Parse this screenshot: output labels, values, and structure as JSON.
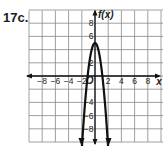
{
  "problem_label": "17c.",
  "chart_data": {
    "type": "line",
    "title": "",
    "xlabel": "x",
    "ylabel": "f(x)",
    "xlim": [
      -10,
      10
    ],
    "ylim": [
      -10,
      10
    ],
    "grid": true,
    "grid_step": 2,
    "x_ticks": [
      -8,
      -6,
      -4,
      -2,
      2,
      4,
      6,
      8
    ],
    "y_ticks": [
      8,
      6,
      2,
      -4,
      -6,
      -8
    ],
    "origin_label": "O",
    "series": [
      {
        "name": "f(x)",
        "equation": "f(x) = -4x^2 + 5 (approx.)",
        "vertex": [
          0,
          5
        ],
        "x_intercepts": [
          -1.1,
          1.1
        ],
        "x": [
          -2.3,
          -2,
          -1.5,
          -1,
          -0.5,
          0,
          0.5,
          1,
          1.5,
          2,
          2.3
        ],
        "values": [
          -16.2,
          -11,
          -4,
          1,
          4,
          5,
          4,
          1,
          -4,
          -11,
          -16.2
        ],
        "arrows_both_ends": true
      }
    ]
  }
}
